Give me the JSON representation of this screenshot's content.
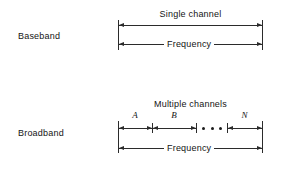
{
  "figure": {
    "rows": [
      {
        "name": "baseband",
        "label": "Baseband",
        "channel_caption": "Single channel",
        "axis_caption": "Frequency",
        "segments": []
      },
      {
        "name": "broadband",
        "label": "Broadband",
        "channel_caption": "Multiple channels",
        "axis_caption": "Frequency",
        "segments": [
          {
            "label": "A"
          },
          {
            "label": "B"
          },
          {
            "label": "• • •"
          },
          {
            "label": "N"
          }
        ]
      }
    ],
    "colors": {
      "background": "#ffffff",
      "stroke": "#2b2b2b",
      "text": "#141414"
    }
  }
}
